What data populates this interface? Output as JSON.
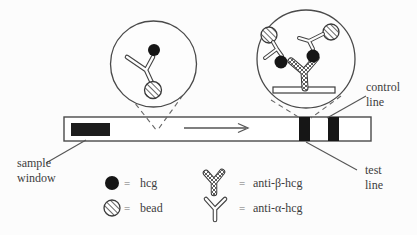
{
  "diagram": {
    "labels": {
      "sample_window": {
        "line1": "sample",
        "line2": "window"
      },
      "control_line": {
        "line1": "control",
        "line2": "line"
      },
      "test_line": {
        "line1": "test",
        "line2": "line"
      }
    },
    "legend": {
      "items": [
        {
          "symbol": "hcg-dot",
          "eq": "=",
          "label": "hcg"
        },
        {
          "symbol": "bead",
          "eq": "=",
          "label": "bead"
        },
        {
          "symbol": "anti-beta-hcg-antibody",
          "eq": "=",
          "label": "anti-β-hcg"
        },
        {
          "symbol": "anti-alpha-hcg-antibody",
          "eq": "=",
          "label": "anti-α-hcg"
        }
      ]
    },
    "colors": {
      "ink": "#3c3c3c",
      "band_fill": "#161616",
      "background": "#fcfcfc"
    }
  }
}
